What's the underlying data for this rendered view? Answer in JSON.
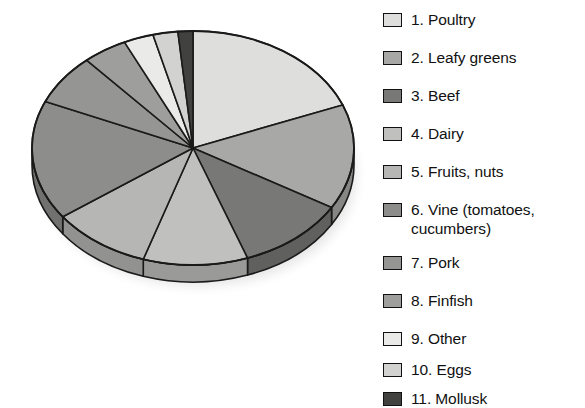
{
  "chart_data": {
    "type": "pie",
    "title": "",
    "subtitle": "",
    "xlabel": "",
    "ylabel": "",
    "legend_position": "right",
    "grid": false,
    "three_d": true,
    "start_angle_deg": 0,
    "direction": "clockwise",
    "categories": [
      "1. Poultry",
      "2. Leafy greens",
      "3. Beef",
      "4. Dairy",
      "5. Fruits, nuts",
      "6. Vine (tomatoes, cucumbers)",
      "7. Pork",
      "8. Finfish",
      "9. Other",
      "10. Eggs",
      "11. Mollusk"
    ],
    "values": [
      19.0,
      14.5,
      11.0,
      10.5,
      10.0,
      16.5,
      7.0,
      4.5,
      3.0,
      2.5,
      1.5
    ],
    "unit": "percent",
    "slice_colors": [
      "#dededc",
      "#a8a8a6",
      "#787876",
      "#c0c0be",
      "#b6b6b4",
      "#8d8d8b",
      "#959593",
      "#9e9e9c",
      "#eaeae8",
      "#d2d2d0",
      "#414140"
    ]
  },
  "legend": {
    "items": [
      {
        "label": "1. Poultry",
        "color": "#dededc"
      },
      {
        "label": "2. Leafy greens",
        "color": "#a8a8a6"
      },
      {
        "label": "3. Beef",
        "color": "#787876"
      },
      {
        "label": "4. Dairy",
        "color": "#c0c0be"
      },
      {
        "label": "5. Fruits, nuts",
        "color": "#b6b6b4"
      },
      {
        "label": "6. Vine (tomatoes,\ncucumbers)",
        "color": "#8d8d8b"
      },
      {
        "label": "7. Pork",
        "color": "#959593"
      },
      {
        "label": "8. Finfish",
        "color": "#9e9e9c"
      },
      {
        "label": "9. Other",
        "color": "#eaeae8"
      },
      {
        "label": "10. Eggs",
        "color": "#d2d2d0"
      },
      {
        "label": "11. Mollusk",
        "color": "#414140"
      }
    ]
  },
  "geometry": {
    "cx": 193,
    "cy": 148,
    "rx": 161,
    "ry": 117,
    "depth": 17,
    "stroke": "#1a1a1a"
  }
}
